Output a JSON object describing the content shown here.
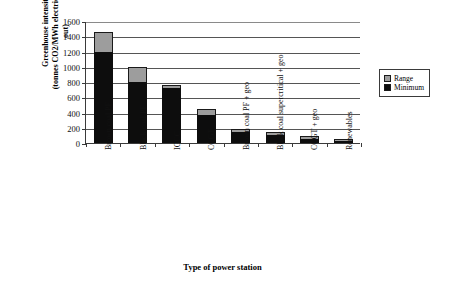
{
  "chart_data": {
    "type": "bar",
    "title": "",
    "subtitle": "",
    "xlabel": "Type of power station",
    "ylabel_line1": "Greenhouse intensity",
    "ylabel_line2": "(tonnes CO2/MWh electricity sent out)",
    "ylim": [
      0,
      1600
    ],
    "ytick_step": 200,
    "yticks": [
      "0",
      "200",
      "400",
      "600",
      "800",
      "1000",
      "1200",
      "1400",
      "1600"
    ],
    "ytick_values": [
      0,
      200,
      400,
      600,
      800,
      1000,
      1200,
      1400,
      1600
    ],
    "grid": true,
    "grid_axis": "y",
    "legend_position": "right",
    "stacked": true,
    "categories": [
      "Brown coal PF",
      "Black coal PF",
      "IGCC",
      "CCGT",
      "Brown coal PF + geo",
      "Black coal supercritical + geo",
      "CCGT + geo",
      "Renewables"
    ],
    "series": [
      {
        "name": "Minimum",
        "color": "#0d0d0d",
        "values": [
          1200,
          800,
          720,
          370,
          140,
          105,
          55,
          10
        ]
      },
      {
        "name": "Range",
        "color": "#9d9d9d",
        "values": [
          250,
          200,
          35,
          80,
          45,
          35,
          15,
          10
        ]
      }
    ],
    "totals": [
      1450,
      1000,
      755,
      450,
      185,
      140,
      70,
      20
    ]
  },
  "legend": {
    "items": [
      {
        "label": "Range",
        "color": "#9d9d9d"
      },
      {
        "label": "Minimum",
        "color": "#0d0d0d"
      }
    ]
  }
}
